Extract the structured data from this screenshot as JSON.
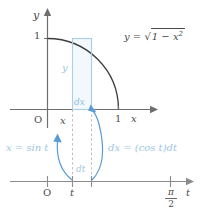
{
  "figure": {
    "colors": {
      "axis": "#6e6e6e",
      "curve": "#3c3c3c",
      "accent_light": "#a8cfe6",
      "accent": "#5b9bd5",
      "text": "#4a4a4a",
      "dashed": "#b8b8b8",
      "rect_fill": "#eef6fb"
    }
  },
  "upper_plot": {
    "y_axis_label": "y",
    "x_axis_label": "x",
    "origin_label": "O",
    "y_tick_label": "1",
    "x_tick_label": "1",
    "curve_label": {
      "lhs": "y =",
      "radicand_lead": "1 − x",
      "radicand_exp": "2",
      "full": "y = √(1 − x²)"
    },
    "rect_height_label": "y",
    "rect_width_label": "dx",
    "x_position_label": "x"
  },
  "lower_axis": {
    "origin_label": "O",
    "t_tick_label": "t",
    "axis_label": "t",
    "end_tick": {
      "numerator": "π",
      "denominator": "2",
      "full": "π/2"
    },
    "dt_label": "dt"
  },
  "annotations": {
    "left": "x = sin t",
    "right": "dx = (cos t)dt"
  }
}
